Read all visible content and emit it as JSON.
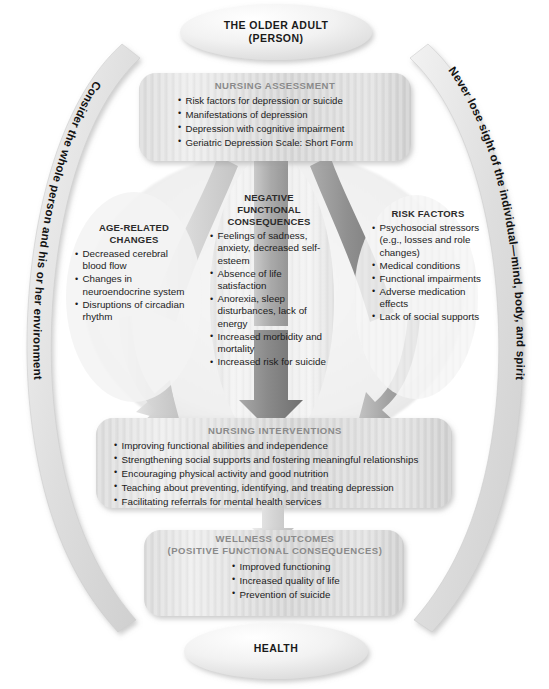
{
  "diagram": {
    "top_ellipse": {
      "line1": "THE OLDER ADULT",
      "line2": "(PERSON)"
    },
    "bottom_ellipse": {
      "label": "HEALTH"
    },
    "left_arc_text": "Consider the whole person and his or her environment",
    "right_arc_text": "Never lose sight of the individual—mind, body, and spirit",
    "nursing_assessment": {
      "heading": "NURSING ASSESSMENT",
      "items": [
        "Risk factors for depression or suicide",
        "Manifestations of depression",
        "Depression with cognitive impairment",
        "Geriatric Depression Scale: Short Form"
      ]
    },
    "age_related_changes": {
      "heading_line1": "AGE-RELATED",
      "heading_line2": "CHANGES",
      "items": [
        "Decreased cerebral blood flow",
        "Changes in neuroendocrine system",
        "Disruptions of circadian rhythm"
      ]
    },
    "negative_functional_consequences": {
      "heading_line1": "NEGATIVE",
      "heading_line2": "FUNCTIONAL",
      "heading_line3": "CONSEQUENCES",
      "items": [
        "Feelings of sadness, anxiety, decreased self-esteem",
        "Absence of life satisfaction",
        "Anorexia, sleep disturbances, lack of energy",
        "Increased morbidity and mortality",
        "Increased risk for suicide"
      ]
    },
    "risk_factors": {
      "heading": "RISK FACTORS",
      "items": [
        "Psychosocial stressors (e.g., losses and role changes)",
        "Medical conditions",
        "Functional impairments",
        "Adverse medication effects",
        "Lack of social supports"
      ]
    },
    "nursing_interventions": {
      "heading": "NURSING INTERVENTIONS",
      "items": [
        "Improving functional abilities and independence",
        "Strengthening social supports and fostering meaningful relationships",
        "Encouraging physical activity and good nutrition",
        "Teaching about preventing, identifying, and treating depression",
        "Facilitating referrals for mental health services"
      ]
    },
    "wellness_outcomes": {
      "heading_line1": "WELLNESS OUTCOMES",
      "heading_line2": "(POSITIVE FUNCTIONAL CONSEQUENCES)",
      "items": [
        "Improved functioning",
        "Increased quality of life",
        "Prevention of suicide"
      ]
    },
    "colors": {
      "page_background": "#ffffff",
      "box_fill_light": "#e9e9e9",
      "box_fill_dark": "#c9c9c9",
      "heading_gray": "#8a8a8a",
      "text_dark": "#1c1c1c",
      "arrow_dark": "#8d8d8d",
      "arrow_light": "#d8d8d8",
      "arc_fill": "#dcdcdc"
    }
  }
}
